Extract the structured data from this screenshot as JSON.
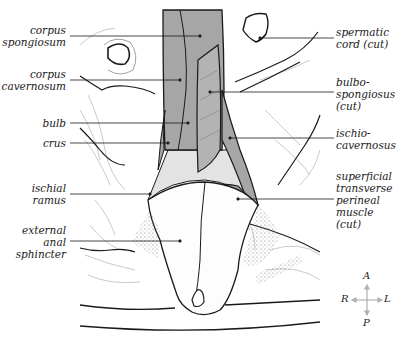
{
  "figure": {
    "colors": {
      "muscle_fill": "#a6a6a6",
      "muscle_fill_light": "#cfcfcf",
      "outline": "#1a1a1a",
      "faint_line": "#b5b5b5",
      "background": "#ffffff"
    }
  },
  "labels": {
    "left": [
      {
        "id": "corpus-spongiosum",
        "text": "corpus\nspongiosum"
      },
      {
        "id": "corpus-cavernosum",
        "text": "corpus\ncavernosum"
      },
      {
        "id": "bulb",
        "text": "bulb"
      },
      {
        "id": "crus",
        "text": "crus"
      },
      {
        "id": "ischial-ramus",
        "text": "ischial\nramus"
      },
      {
        "id": "external-anal-sphincter",
        "text": "external\nanal\nsphincter"
      }
    ],
    "right": [
      {
        "id": "spermatic-cord",
        "text": "spermatic\ncord (cut)"
      },
      {
        "id": "bulbospongiosus",
        "text": "bulbo-\nspongiosus\n(cut)"
      },
      {
        "id": "ischiocavernosus",
        "text": "ischio-\ncavernosus"
      },
      {
        "id": "superficial-transverse-perineal",
        "text": "superficial\ntransverse\nperineal\nmuscle\n(cut)"
      }
    ]
  },
  "compass": {
    "anterior": "A",
    "posterior": "P",
    "right": "R",
    "left": "L"
  }
}
